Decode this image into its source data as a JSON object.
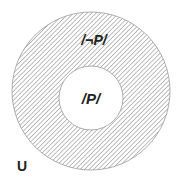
{
  "diagram": {
    "type": "venn",
    "universe_label": "U",
    "outer_region_label": "/¬P/",
    "inner_region_label": "/P/",
    "colors": {
      "hatch": "#8a8a8a",
      "outline": "#9a9a9a",
      "text": "#222222",
      "background": "#ffffff"
    }
  }
}
